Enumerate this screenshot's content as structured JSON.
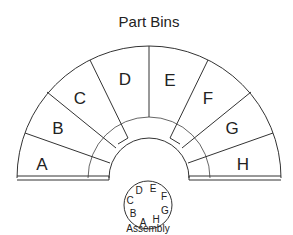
{
  "title": "Part Bins",
  "bins": [
    {
      "label": "A",
      "x": 42,
      "y": 165
    },
    {
      "label": "B",
      "x": 58,
      "y": 129
    },
    {
      "label": "C",
      "x": 80,
      "y": 99
    },
    {
      "label": "D",
      "x": 125,
      "y": 80
    },
    {
      "label": "E",
      "x": 170,
      "y": 81
    },
    {
      "label": "F",
      "x": 208,
      "y": 99
    },
    {
      "label": "G",
      "x": 232,
      "y": 129
    },
    {
      "label": "H",
      "x": 243,
      "y": 165
    }
  ],
  "assembly": {
    "label": "Assembly",
    "slots": [
      {
        "label": "D",
        "x": 139,
        "y": 190
      },
      {
        "label": "E",
        "x": 153,
        "y": 188
      },
      {
        "label": "F",
        "x": 164,
        "y": 195
      },
      {
        "label": "G",
        "x": 165,
        "y": 210
      },
      {
        "label": "H",
        "x": 156,
        "y": 219
      },
      {
        "label": "A",
        "x": 143,
        "y": 222
      },
      {
        "label": "B",
        "x": 133,
        "y": 213
      },
      {
        "label": "C",
        "x": 130,
        "y": 200
      }
    ]
  }
}
